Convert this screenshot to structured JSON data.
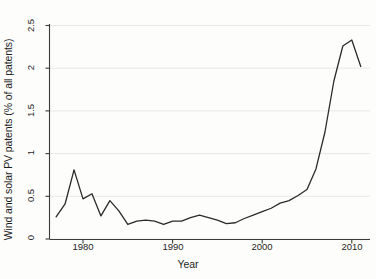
{
  "chart_data": {
    "type": "line",
    "title": "",
    "xlabel": "Year",
    "ylabel": "Wind and solar PV patents (% of all patents)",
    "xlim": [
      1976,
      2012
    ],
    "ylim": [
      0,
      2.5
    ],
    "xticks": [
      1980,
      1990,
      2000,
      2010
    ],
    "xtick_labels": [
      "1980",
      "1990",
      "2000",
      "2010"
    ],
    "yticks": [
      0,
      0.5,
      1,
      1.5,
      2,
      2.5
    ],
    "ytick_labels": [
      "0",
      "0.5",
      "1",
      "1.5",
      "2",
      "2.5"
    ],
    "grid": "horizontal",
    "legend": "none",
    "line_color": "#2b2b2b",
    "x": [
      1977,
      1978,
      1979,
      1980,
      1981,
      1982,
      1983,
      1984,
      1985,
      1986,
      1987,
      1988,
      1989,
      1990,
      1991,
      1992,
      1993,
      1994,
      1995,
      1996,
      1997,
      1998,
      1999,
      2000,
      2001,
      2002,
      2003,
      2004,
      2005,
      2006,
      2007,
      2008,
      2009,
      2010,
      2011
    ],
    "values": [
      0.26,
      0.41,
      0.81,
      0.47,
      0.53,
      0.27,
      0.45,
      0.33,
      0.17,
      0.21,
      0.22,
      0.21,
      0.17,
      0.21,
      0.21,
      0.25,
      0.28,
      0.25,
      0.22,
      0.18,
      0.19,
      0.24,
      0.28,
      0.32,
      0.36,
      0.42,
      0.45,
      0.51,
      0.58,
      0.82,
      1.25,
      1.85,
      2.26,
      2.33,
      2.02
    ],
    "series": [
      {
        "name": "Wind and solar PV patents",
        "values": [
          0.26,
          0.41,
          0.81,
          0.47,
          0.53,
          0.27,
          0.45,
          0.33,
          0.17,
          0.21,
          0.22,
          0.21,
          0.17,
          0.21,
          0.21,
          0.25,
          0.28,
          0.25,
          0.22,
          0.18,
          0.19,
          0.24,
          0.28,
          0.32,
          0.36,
          0.42,
          0.45,
          0.51,
          0.58,
          0.82,
          1.25,
          1.85,
          2.26,
          2.33,
          2.02
        ]
      }
    ]
  },
  "axes": {
    "y_title": "Wind and solar PV patents (% of all patents)",
    "x_title": "Year",
    "y_labels": [
      "2.5",
      "2",
      "1.5",
      "1",
      "0.5",
      "0"
    ],
    "x_labels": [
      "1980",
      "1990",
      "2000",
      "2010"
    ]
  }
}
